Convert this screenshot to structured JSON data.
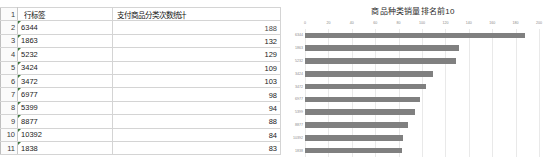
{
  "spreadsheet": {
    "header": {
      "row_number": "1",
      "label_col": "行标签",
      "value_col": "支付商品分类次数统计"
    },
    "row_numbers": [
      "1",
      "2",
      "3",
      "4",
      "5",
      "6",
      "7",
      "8",
      "9",
      "10",
      "11"
    ],
    "rows": [
      {
        "row_num": "2",
        "label": "6344",
        "value": "188",
        "bar_pct": 100.0,
        "value_over_bar": true
      },
      {
        "row_num": "3",
        "label": "1863",
        "value": "132",
        "bar_pct": 70.2,
        "value_over_bar": false
      },
      {
        "row_num": "4",
        "label": "5232",
        "value": "129",
        "bar_pct": 68.6,
        "value_over_bar": false
      },
      {
        "row_num": "5",
        "label": "3424",
        "value": "109",
        "bar_pct": 58.0,
        "value_over_bar": false
      },
      {
        "row_num": "6",
        "label": "3472",
        "value": "103",
        "bar_pct": 54.8,
        "value_over_bar": false
      },
      {
        "row_num": "7",
        "label": "6977",
        "value": "98",
        "bar_pct": 52.1,
        "value_over_bar": false
      },
      {
        "row_num": "8",
        "label": "5399",
        "value": "94",
        "bar_pct": 50.0,
        "value_over_bar": false
      },
      {
        "row_num": "9",
        "label": "8877",
        "value": "88",
        "bar_pct": 46.8,
        "value_over_bar": false
      },
      {
        "row_num": "10",
        "label": "10392",
        "value": "84",
        "bar_pct": 44.7,
        "value_over_bar": false
      },
      {
        "row_num": "11",
        "label": "1838",
        "value": "83",
        "bar_pct": 44.1,
        "value_over_bar": false
      }
    ],
    "databar_color": "#5a5a5a",
    "gridline_color": "#d4d4d4"
  },
  "chart_data": {
    "type": "bar",
    "orientation": "horizontal",
    "title": "商品种类销量排名前10",
    "xlabel": "",
    "ylabel": "",
    "categories": [
      "6344",
      "1863",
      "5232",
      "3424",
      "3472",
      "6977",
      "5399",
      "8877",
      "10392",
      "1838"
    ],
    "values": [
      188,
      132,
      129,
      109,
      103,
      98,
      94,
      88,
      84,
      83
    ],
    "xlim": [
      0,
      200
    ],
    "xticks": [
      0,
      20,
      40,
      60,
      80,
      100,
      120,
      140,
      160,
      180,
      200
    ],
    "xtick_labels": [
      "0",
      "20",
      "40",
      "60",
      "80",
      "100",
      "120",
      "140",
      "160",
      "180",
      "200"
    ],
    "grid": true,
    "legend": false,
    "bar_color": "#808080",
    "axis_label_color": "#8a8a8a",
    "xaxis_position": "top"
  }
}
